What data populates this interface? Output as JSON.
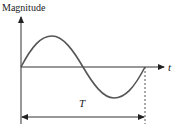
{
  "diagram": {
    "type": "sine-wave-period",
    "y_axis_label": "Magnitude",
    "x_axis_label": "t",
    "period_label": "T",
    "colors": {
      "axes": "#333333",
      "wave": "#555555",
      "dashed": "#555555"
    },
    "wave": {
      "cycles": 1,
      "start_phase": "zero-crossing rising",
      "peak_fraction": 0.25,
      "trough_fraction": 0.75
    }
  }
}
